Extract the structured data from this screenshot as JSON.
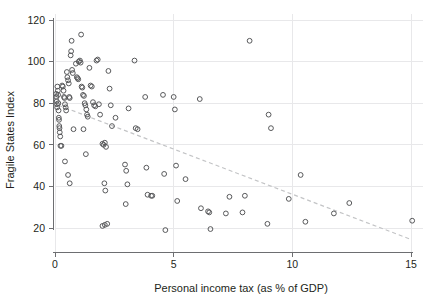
{
  "chart_data": {
    "type": "scatter",
    "title": "",
    "xlabel": "Personal income tax (as % of GDP)",
    "ylabel": "Fragile States Index",
    "xlim": [
      0,
      15
    ],
    "ylim": [
      13,
      120
    ],
    "xticks": [
      0,
      5,
      10,
      15
    ],
    "xtick_labels": [
      "0",
      "5",
      "10",
      "15"
    ],
    "yticks": [
      20,
      40,
      60,
      80,
      100,
      120
    ],
    "ytick_labels": [
      "20",
      "40",
      "60",
      "80",
      "100",
      "120"
    ],
    "grid": "both-faint",
    "legend": "none",
    "marker": "open-circle",
    "marker_color": "#58595b",
    "trendline": {
      "type": "linear-dashed",
      "color": "#c3c4c6",
      "x_start": 0.15,
      "y_start": 79.0,
      "x_end": 15.0,
      "y_end": 14.5
    },
    "points": [
      {
        "x": 0.05,
        "y": 84.5
      },
      {
        "x": 0.06,
        "y": 83.0
      },
      {
        "x": 0.07,
        "y": 81.0
      },
      {
        "x": 0.08,
        "y": 79.5
      },
      {
        "x": 0.09,
        "y": 78.0
      },
      {
        "x": 0.1,
        "y": 88.0
      },
      {
        "x": 0.12,
        "y": 86.0
      },
      {
        "x": 0.13,
        "y": 84.0
      },
      {
        "x": 0.14,
        "y": 80.0
      },
      {
        "x": 0.15,
        "y": 76.5
      },
      {
        "x": 0.16,
        "y": 73.0
      },
      {
        "x": 0.17,
        "y": 72.0
      },
      {
        "x": 0.18,
        "y": 69.0
      },
      {
        "x": 0.19,
        "y": 68.0
      },
      {
        "x": 0.2,
        "y": 66.0
      },
      {
        "x": 0.22,
        "y": 64.0
      },
      {
        "x": 0.23,
        "y": 59.5
      },
      {
        "x": 0.27,
        "y": 59.5
      },
      {
        "x": 0.3,
        "y": 88.5
      },
      {
        "x": 0.33,
        "y": 88.0
      },
      {
        "x": 0.36,
        "y": 86.0
      },
      {
        "x": 0.38,
        "y": 83.0
      },
      {
        "x": 0.4,
        "y": 82.5
      },
      {
        "x": 0.42,
        "y": 79.5
      },
      {
        "x": 0.45,
        "y": 78.0
      },
      {
        "x": 0.47,
        "y": 76.5
      },
      {
        "x": 0.5,
        "y": 95.0
      },
      {
        "x": 0.52,
        "y": 92.5
      },
      {
        "x": 0.55,
        "y": 91.0
      },
      {
        "x": 0.58,
        "y": 89.5
      },
      {
        "x": 0.6,
        "y": 83.0
      },
      {
        "x": 0.62,
        "y": 82.5
      },
      {
        "x": 0.66,
        "y": 103.0
      },
      {
        "x": 0.68,
        "y": 105.0
      },
      {
        "x": 0.7,
        "y": 110.0
      },
      {
        "x": 0.72,
        "y": 96.0
      },
      {
        "x": 0.75,
        "y": 94.5
      },
      {
        "x": 0.78,
        "y": 67.5
      },
      {
        "x": 0.42,
        "y": 52.0
      },
      {
        "x": 0.55,
        "y": 45.5
      },
      {
        "x": 0.62,
        "y": 41.5
      },
      {
        "x": 0.88,
        "y": 99.0
      },
      {
        "x": 0.92,
        "y": 92.5
      },
      {
        "x": 0.95,
        "y": 92.0
      },
      {
        "x": 0.98,
        "y": 91.5
      },
      {
        "x": 1.0,
        "y": 100.0
      },
      {
        "x": 1.05,
        "y": 100.5
      },
      {
        "x": 1.08,
        "y": 99.5
      },
      {
        "x": 1.1,
        "y": 113.0
      },
      {
        "x": 1.12,
        "y": 88.0
      },
      {
        "x": 1.15,
        "y": 87.5
      },
      {
        "x": 1.18,
        "y": 84.0
      },
      {
        "x": 1.22,
        "y": 83.5
      },
      {
        "x": 1.25,
        "y": 80.0
      },
      {
        "x": 1.28,
        "y": 79.0
      },
      {
        "x": 1.32,
        "y": 77.0
      },
      {
        "x": 1.35,
        "y": 74.5
      },
      {
        "x": 1.38,
        "y": 73.5
      },
      {
        "x": 1.2,
        "y": 67.5
      },
      {
        "x": 1.3,
        "y": 55.5
      },
      {
        "x": 1.45,
        "y": 97.0
      },
      {
        "x": 1.5,
        "y": 88.5
      },
      {
        "x": 1.55,
        "y": 88.0
      },
      {
        "x": 1.6,
        "y": 80.5
      },
      {
        "x": 1.65,
        "y": 79.0
      },
      {
        "x": 1.7,
        "y": 78.5
      },
      {
        "x": 1.75,
        "y": 100.5
      },
      {
        "x": 1.8,
        "y": 101.0
      },
      {
        "x": 1.85,
        "y": 79.5
      },
      {
        "x": 1.9,
        "y": 74.5
      },
      {
        "x": 2.0,
        "y": 60.5
      },
      {
        "x": 2.05,
        "y": 60.0
      },
      {
        "x": 2.1,
        "y": 61.0
      },
      {
        "x": 2.15,
        "y": 59.0
      },
      {
        "x": 2.0,
        "y": 21.0
      },
      {
        "x": 2.1,
        "y": 21.5
      },
      {
        "x": 2.2,
        "y": 22.0
      },
      {
        "x": 2.08,
        "y": 41.5
      },
      {
        "x": 2.12,
        "y": 38.0
      },
      {
        "x": 2.25,
        "y": 95.5
      },
      {
        "x": 2.3,
        "y": 87.0
      },
      {
        "x": 2.35,
        "y": 79.0
      },
      {
        "x": 2.4,
        "y": 69.0
      },
      {
        "x": 2.55,
        "y": 73.0
      },
      {
        "x": 2.95,
        "y": 50.5
      },
      {
        "x": 3.0,
        "y": 47.5
      },
      {
        "x": 3.05,
        "y": 41.0
      },
      {
        "x": 2.98,
        "y": 31.5
      },
      {
        "x": 3.1,
        "y": 77.5
      },
      {
        "x": 3.35,
        "y": 100.5
      },
      {
        "x": 3.4,
        "y": 68.0
      },
      {
        "x": 3.48,
        "y": 67.5
      },
      {
        "x": 3.8,
        "y": 83.0
      },
      {
        "x": 3.85,
        "y": 49.0
      },
      {
        "x": 3.9,
        "y": 36.0
      },
      {
        "x": 4.05,
        "y": 35.5
      },
      {
        "x": 4.1,
        "y": 35.5
      },
      {
        "x": 4.55,
        "y": 84.0
      },
      {
        "x": 4.6,
        "y": 46.0
      },
      {
        "x": 4.65,
        "y": 19.0
      },
      {
        "x": 5.0,
        "y": 83.0
      },
      {
        "x": 5.05,
        "y": 77.0
      },
      {
        "x": 5.1,
        "y": 50.0
      },
      {
        "x": 5.15,
        "y": 33.0
      },
      {
        "x": 5.5,
        "y": 43.5
      },
      {
        "x": 6.1,
        "y": 82.0
      },
      {
        "x": 6.15,
        "y": 29.5
      },
      {
        "x": 6.45,
        "y": 28.0
      },
      {
        "x": 6.5,
        "y": 27.5
      },
      {
        "x": 6.55,
        "y": 19.5
      },
      {
        "x": 7.2,
        "y": 27.0
      },
      {
        "x": 7.35,
        "y": 35.0
      },
      {
        "x": 7.9,
        "y": 27.5
      },
      {
        "x": 8.0,
        "y": 35.5
      },
      {
        "x": 8.2,
        "y": 110.0
      },
      {
        "x": 8.95,
        "y": 22.0
      },
      {
        "x": 9.0,
        "y": 74.5
      },
      {
        "x": 9.1,
        "y": 68.0
      },
      {
        "x": 9.85,
        "y": 34.0
      },
      {
        "x": 10.35,
        "y": 45.5
      },
      {
        "x": 10.55,
        "y": 23.0
      },
      {
        "x": 11.75,
        "y": 27.0
      },
      {
        "x": 12.4,
        "y": 32.0
      },
      {
        "x": 15.05,
        "y": 23.5
      }
    ]
  }
}
